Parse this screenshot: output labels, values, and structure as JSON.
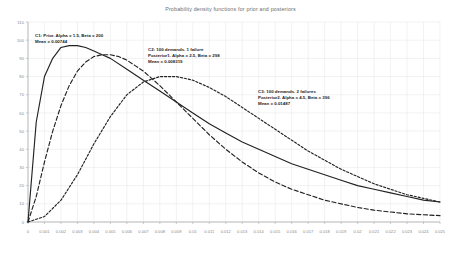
{
  "chart_data": {
    "type": "line",
    "title": "Probability density functions for prior and posteriors",
    "xlabel": "",
    "ylabel": "",
    "xlim": [
      0,
      0.025
    ],
    "ylim": [
      0,
      110
    ],
    "grid": true,
    "legend_position": "inline-annotations",
    "x_tick_labels": [
      "0",
      "0.001",
      "0.002",
      "0.003",
      "0.004",
      "0.005",
      "0.006",
      "0.007",
      "0.008",
      "0.009",
      "0.01",
      "0.011",
      "0.012",
      "0.013",
      "0.014",
      "0.015",
      "0.016",
      "0.017",
      "0.018",
      "0.019",
      "0.02",
      "0.021",
      "0.022",
      "0.023",
      "0.024",
      "0.025"
    ],
    "x_tick_values": [
      0,
      0.001,
      0.002,
      0.003,
      0.004,
      0.005,
      0.006,
      0.007,
      0.008,
      0.009,
      0.01,
      0.011,
      0.012,
      0.013,
      0.014,
      0.015,
      0.016,
      0.017,
      0.018,
      0.019,
      0.02,
      0.021,
      0.022,
      0.023,
      0.024,
      0.025
    ],
    "y_tick_labels": [
      "0",
      "10",
      "20",
      "30",
      "40",
      "50",
      "60",
      "70",
      "80",
      "90",
      "100",
      "110"
    ],
    "y_tick_values": [
      0,
      10,
      20,
      30,
      40,
      50,
      60,
      70,
      80,
      90,
      100,
      110
    ],
    "series": [
      {
        "name": "C1: Prior. Alpha = 1.5, Beta = 200",
        "style": "solid",
        "color": "#222222",
        "alpha": 1.5,
        "beta": 200,
        "mean": 0.00744,
        "x": [
          0,
          0.0005,
          0.001,
          0.0015,
          0.002,
          0.0025,
          0.003,
          0.0035,
          0.004,
          0.0045,
          0.005,
          0.006,
          0.007,
          0.008,
          0.009,
          0.01,
          0.011,
          0.012,
          0.013,
          0.014,
          0.015,
          0.016,
          0.017,
          0.018,
          0.019,
          0.02,
          0.021,
          0.022,
          0.023,
          0.024,
          0.025
        ],
        "y": [
          0,
          55,
          80,
          90,
          96,
          97,
          97,
          96,
          94,
          92,
          90,
          84,
          78,
          72,
          66,
          60,
          54,
          49,
          44,
          40,
          36,
          32,
          29,
          26,
          23,
          20,
          18,
          16,
          14,
          12,
          11
        ]
      },
      {
        "name": "C2: 100 demands. 1 failure, Posterior1. Alpha = 2.5, Beta = 298",
        "style": "dashed",
        "color": "#222222",
        "alpha": 2.5,
        "beta": 298,
        "mean": 0.008319,
        "x": [
          0,
          0.0005,
          0.001,
          0.0015,
          0.002,
          0.0025,
          0.003,
          0.0035,
          0.004,
          0.0045,
          0.005,
          0.0055,
          0.006,
          0.0065,
          0.007,
          0.0075,
          0.008,
          0.009,
          0.01,
          0.011,
          0.012,
          0.013,
          0.014,
          0.015,
          0.016,
          0.017,
          0.018,
          0.019,
          0.02,
          0.021,
          0.022,
          0.023,
          0.024,
          0.025
        ],
        "y": [
          0,
          14,
          33,
          50,
          64,
          75,
          83,
          88,
          91,
          92,
          92,
          91,
          89,
          86,
          83,
          79,
          75,
          66,
          57,
          48,
          40,
          33,
          27,
          22,
          18,
          15,
          12,
          10,
          8,
          6.5,
          5.5,
          4.5,
          4,
          3.5
        ]
      },
      {
        "name": "C3: 100 demands. 2 failures, Posterior2. Alpha = 4.5, Beta = 396",
        "style": "dotted",
        "color": "#222222",
        "alpha": 4.5,
        "beta": 396,
        "mean": 0.01487,
        "x": [
          0,
          0.001,
          0.002,
          0.003,
          0.004,
          0.005,
          0.006,
          0.007,
          0.008,
          0.009,
          0.01,
          0.011,
          0.012,
          0.013,
          0.014,
          0.015,
          0.016,
          0.017,
          0.018,
          0.019,
          0.02,
          0.021,
          0.022,
          0.023,
          0.024,
          0.025
        ],
        "y": [
          0,
          3,
          12,
          26,
          43,
          58,
          70,
          77,
          80,
          80,
          78,
          74,
          69,
          63,
          57,
          51,
          45,
          39,
          34,
          29,
          25,
          21,
          18,
          15,
          13,
          11
        ]
      }
    ],
    "annotations": [
      {
        "id": "c1",
        "lines": [
          "C1: Prior. Alpha = 1.5, Beta = 200",
          "Mean = 0.00744"
        ]
      },
      {
        "id": "c2",
        "lines": [
          "C2: 100 demands. 1 failure",
          "Posterior1. Alpha = 2.5, Beta = 298",
          "Mean = 0.008319"
        ]
      },
      {
        "id": "c3",
        "lines": [
          "C3: 100 demands. 2 failures",
          "Posterior2. Alpha = 4.5, Beta = 396",
          "Mean = 0.01487"
        ]
      }
    ]
  },
  "colors": {
    "grid": "#eaeaea",
    "axis": "#b4b4b4",
    "line": "#222222",
    "tick_text": "#8a8a8a",
    "title_text": "#6e6e6e",
    "annot_text": "#1d1d1d",
    "background": "#ffffff"
  }
}
